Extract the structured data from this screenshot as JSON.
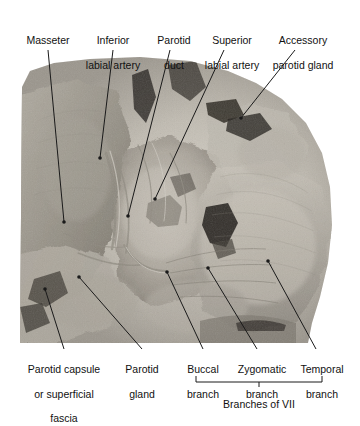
{
  "figure": {
    "kind": "anatomical-dissection-photograph",
    "orientation": "left lateral",
    "background_color": "#ffffff",
    "text_color": "#111111",
    "leader_color": "#1a1a1a",
    "photo": {
      "left": 20,
      "top": 57,
      "width": 320,
      "height": 286,
      "tone_light": "#d9d6cf",
      "tone_mid": "#a8a49c",
      "tone_dark": "#5a5650",
      "tone_deep": "#201e1c"
    }
  },
  "labels": {
    "top": [
      {
        "id": "masseter",
        "name": "label-masseter",
        "lines": [
          "Masseter"
        ],
        "text_x": 48,
        "text_y": 34,
        "leader": {
          "x1": 48,
          "y1": 50,
          "x2": 64,
          "y2": 222,
          "dot": true
        }
      },
      {
        "id": "inferior-labial-artery",
        "name": "label-inferior-labial-artery",
        "lines": [
          "Inferior",
          "labial artery"
        ],
        "text_x": 113,
        "text_y": 22,
        "leader": {
          "x1": 113,
          "y1": 50,
          "x2": 100,
          "y2": 158,
          "dot": true
        }
      },
      {
        "id": "parotid-duct",
        "name": "label-parotid-duct",
        "lines": [
          "Parotid",
          "duct"
        ],
        "text_x": 174,
        "text_y": 22,
        "leader": {
          "x1": 170,
          "y1": 50,
          "x2": 128,
          "y2": 216,
          "dot": true
        }
      },
      {
        "id": "superior-labial-artery",
        "name": "label-superior-labial-artery",
        "lines": [
          "Superior",
          "labial artery"
        ],
        "text_x": 232,
        "text_y": 22,
        "leader": {
          "x1": 224,
          "y1": 50,
          "x2": 155,
          "y2": 199,
          "dot": true
        }
      },
      {
        "id": "accessory-parotid-gland",
        "name": "label-accessory-parotid-gland",
        "lines": [
          "Accessory",
          "parotid gland"
        ],
        "text_x": 303,
        "text_y": 22,
        "leader": {
          "x1": 295,
          "y1": 50,
          "x2": 241,
          "y2": 118,
          "dot": true
        }
      }
    ],
    "bottom": [
      {
        "id": "parotid-capsule",
        "name": "label-parotid-capsule-or-superficial-fascia",
        "lines": [
          "Parotid capsule",
          "or superficial",
          "fascia"
        ],
        "text_x": 64,
        "text_y": 351,
        "leader": {
          "x1": 64,
          "y1": 349,
          "x2": 45,
          "y2": 289,
          "dot": true
        }
      },
      {
        "id": "parotid-gland",
        "name": "label-parotid-gland",
        "lines": [
          "Parotid",
          "gland"
        ],
        "text_x": 142,
        "text_y": 351,
        "leader": {
          "x1": 142,
          "y1": 349,
          "x2": 79,
          "y2": 277,
          "dot": true
        }
      },
      {
        "id": "buccal-branch",
        "name": "label-buccal-branch",
        "lines": [
          "Buccal",
          "branch"
        ],
        "text_x": 203,
        "text_y": 351,
        "leader": {
          "x1": 203,
          "y1": 349,
          "x2": 167,
          "y2": 272,
          "dot": true
        }
      },
      {
        "id": "zygomatic-branch",
        "name": "label-zygomatic-branch",
        "lines": [
          "Zygomatic",
          "branch"
        ],
        "text_x": 262,
        "text_y": 351,
        "leader": {
          "x1": 257,
          "y1": 349,
          "x2": 208,
          "y2": 268,
          "dot": true
        }
      },
      {
        "id": "temporal-branch",
        "name": "label-temporal-branch",
        "lines": [
          "Temporal",
          "branch"
        ],
        "text_x": 322,
        "text_y": 351,
        "leader": {
          "x1": 316,
          "y1": 349,
          "x2": 268,
          "y2": 261,
          "dot": true
        }
      }
    ],
    "group": {
      "id": "branches-of-vii",
      "name": "label-branches-of-vii",
      "text": "Branches of VII",
      "text_x": 259,
      "text_y": 390,
      "bracket": {
        "x1": 196,
        "x2": 322,
        "y": 382,
        "tick": 6,
        "stem_x": 259,
        "stem_len": 5
      }
    }
  }
}
